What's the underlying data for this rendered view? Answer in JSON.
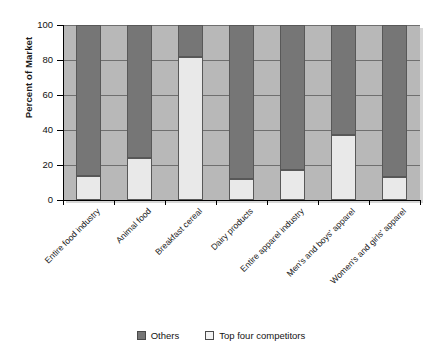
{
  "chart_data": {
    "type": "bar",
    "subtype": "stacked-bar-100",
    "title": "",
    "xlabel": "",
    "ylabel": "Percent of Market",
    "ylim": [
      0,
      100
    ],
    "yticks": [
      0,
      20,
      40,
      60,
      80,
      100
    ],
    "grid": true,
    "legend_position": "bottom",
    "categories": [
      "Entire food industry",
      "Animal food",
      "Breakfast cereal",
      "Dairy products",
      "Entire apparel industry",
      "Men's and boys' apparel",
      "Women's and girls' apparel"
    ],
    "series": [
      {
        "name": "Top four competitors",
        "color": "#e9e9e9",
        "values": [
          14,
          24,
          82,
          12,
          17,
          37,
          13
        ]
      },
      {
        "name": "Others",
        "color": "#767676",
        "values": [
          86,
          76,
          18,
          88,
          83,
          63,
          87
        ]
      }
    ]
  },
  "axes": {
    "y_title": "Percent of Market",
    "y_tick_labels": [
      "100",
      "80",
      "60",
      "40",
      "20",
      "0"
    ]
  },
  "legend": {
    "items": [
      {
        "label": "Others",
        "swatch": "dark"
      },
      {
        "label": "Top four competitors",
        "swatch": "light"
      }
    ]
  },
  "colors": {
    "plot_background": "#b8b8b8",
    "gridline": "#6f6f6f",
    "series_others": "#767676",
    "series_top_four": "#e9e9e9",
    "axis": "#000000",
    "text": "#1a1a1a"
  }
}
